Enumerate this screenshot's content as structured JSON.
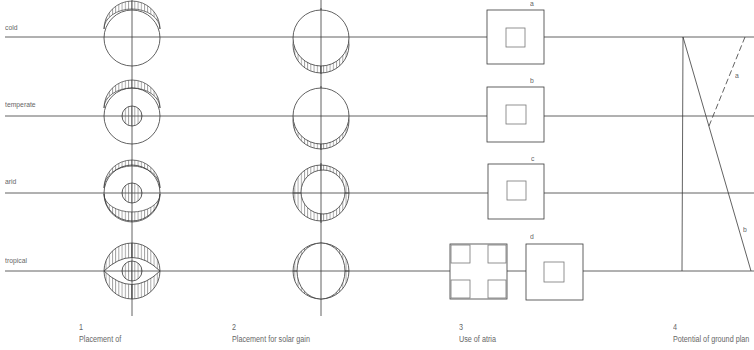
{
  "colors": {
    "line": "#3a3a3a",
    "hatch": "#555555",
    "text": "#666666",
    "background": "#ffffff"
  },
  "rows": [
    {
      "label": "cold",
      "y": 37
    },
    {
      "label": "temperate",
      "y": 116
    },
    {
      "label": "arid",
      "y": 193
    },
    {
      "label": "tropical",
      "y": 271
    }
  ],
  "columns": [
    {
      "number": "1",
      "caption": "Placement of",
      "x": 132,
      "type": "circle-hatch-placement"
    },
    {
      "number": "2",
      "caption": "Placement for solar gain",
      "x": 321,
      "type": "circle-solar-gain"
    },
    {
      "number": "3",
      "caption": "Use of atria",
      "x": 515,
      "type": "atria-squares"
    },
    {
      "number": "4",
      "caption": "Potential of ground plan",
      "x": 683,
      "type": "ground-plan-lines"
    }
  ],
  "column1": {
    "radius": 28,
    "cells": [
      {
        "row": "cold",
        "top_crescent": 8,
        "bottom_crescent": 0,
        "core": false
      },
      {
        "row": "temperate",
        "top_crescent": 8,
        "bottom_crescent": 0,
        "core": true
      },
      {
        "row": "arid",
        "top_crescent": 6,
        "bottom_crescent": 10,
        "core": true
      },
      {
        "row": "tropical",
        "top_crescent": 16,
        "bottom_crescent": 16,
        "core": true
      }
    ]
  },
  "column2": {
    "radius": 28,
    "cells": [
      {
        "row": "cold",
        "mode": "bottom",
        "offset": 8
      },
      {
        "row": "temperate",
        "mode": "bottom",
        "offset": 6
      },
      {
        "row": "arid",
        "mode": "ring",
        "offset": 5
      },
      {
        "row": "tropical",
        "mode": "sides",
        "offset": 8
      }
    ]
  },
  "column3": {
    "atria": [
      {
        "label": "a",
        "row": "cold"
      },
      {
        "label": "b",
        "row": "temperate"
      },
      {
        "label": "c",
        "row": "arid"
      },
      {
        "label": "d",
        "row": "tropical"
      }
    ]
  },
  "column4": {
    "labels": [
      {
        "label": "a",
        "x": 735,
        "y": 78
      },
      {
        "label": "b",
        "x": 741,
        "y": 232
      }
    ]
  }
}
